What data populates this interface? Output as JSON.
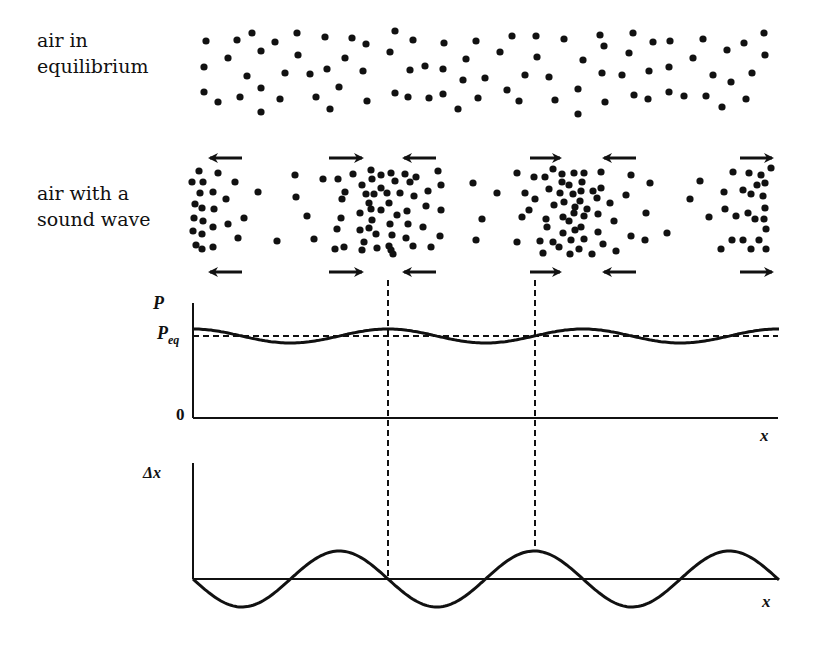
{
  "labels": {
    "equilibrium": "air in\nequilibrium",
    "sound_wave": "air with a\nsound wave"
  },
  "pressure_plot": {
    "y_label": "P",
    "eq_label_main": "P",
    "eq_label_sub": "eq",
    "zero_label": "0",
    "x_label": "x"
  },
  "displacement_plot": {
    "y_label": "Δx",
    "x_label": "x"
  },
  "colors": {
    "ink": "#111111",
    "background": "#ffffff"
  },
  "equilibrium_dots": [
    [
      206,
      41
    ],
    [
      237,
      40
    ],
    [
      252,
      33
    ],
    [
      261,
      51
    ],
    [
      275,
      42
    ],
    [
      297,
      33
    ],
    [
      298,
      55
    ],
    [
      325,
      37
    ],
    [
      352,
      38
    ],
    [
      366,
      44
    ],
    [
      395,
      31
    ],
    [
      413,
      40
    ],
    [
      444,
      43
    ],
    [
      476,
      41
    ],
    [
      390,
      52
    ],
    [
      228,
      58
    ],
    [
      204,
      67
    ],
    [
      247,
      76
    ],
    [
      285,
      73
    ],
    [
      310,
      74
    ],
    [
      327,
      69
    ],
    [
      345,
      58
    ],
    [
      363,
      71
    ],
    [
      410,
      70
    ],
    [
      425,
      66
    ],
    [
      443,
      69
    ],
    [
      466,
      59
    ],
    [
      463,
      80
    ],
    [
      204,
      92
    ],
    [
      218,
      102
    ],
    [
      240,
      97
    ],
    [
      261,
      88
    ],
    [
      280,
      99
    ],
    [
      261,
      112
    ],
    [
      316,
      97
    ],
    [
      339,
      87
    ],
    [
      330,
      109
    ],
    [
      367,
      101
    ],
    [
      395,
      93
    ],
    [
      408,
      97
    ],
    [
      429,
      98
    ],
    [
      443,
      94
    ],
    [
      458,
      109
    ],
    [
      478,
      98
    ],
    [
      512,
      36
    ],
    [
      536,
      36
    ],
    [
      564,
      39
    ],
    [
      600,
      35
    ],
    [
      633,
      33
    ],
    [
      653,
      42
    ],
    [
      670,
      41
    ],
    [
      703,
      39
    ],
    [
      764,
      33
    ],
    [
      500,
      52
    ],
    [
      537,
      57
    ],
    [
      583,
      60
    ],
    [
      604,
      46
    ],
    [
      629,
      53
    ],
    [
      693,
      58
    ],
    [
      727,
      50
    ],
    [
      744,
      43
    ],
    [
      765,
      55
    ],
    [
      485,
      78
    ],
    [
      525,
      75
    ],
    [
      549,
      77
    ],
    [
      602,
      73
    ],
    [
      622,
      75
    ],
    [
      649,
      71
    ],
    [
      669,
      67
    ],
    [
      713,
      75
    ],
    [
      731,
      82
    ],
    [
      752,
      73
    ],
    [
      507,
      90
    ],
    [
      519,
      101
    ],
    [
      555,
      100
    ],
    [
      578,
      89
    ],
    [
      578,
      114
    ],
    [
      605,
      102
    ],
    [
      634,
      95
    ],
    [
      648,
      99
    ],
    [
      669,
      92
    ],
    [
      684,
      96
    ],
    [
      706,
      96
    ],
    [
      722,
      107
    ],
    [
      746,
      99
    ]
  ],
  "wave_dots": [
    [
      199,
      171
    ],
    [
      218,
      173
    ],
    [
      192,
      182
    ],
    [
      203,
      182
    ],
    [
      235,
      182
    ],
    [
      200,
      193
    ],
    [
      213,
      192
    ],
    [
      226,
      199
    ],
    [
      258,
      192
    ],
    [
      195,
      204
    ],
    [
      202,
      208
    ],
    [
      214,
      209
    ],
    [
      194,
      218
    ],
    [
      203,
      221
    ],
    [
      213,
      227
    ],
    [
      228,
      224
    ],
    [
      244,
      218
    ],
    [
      193,
      231
    ],
    [
      202,
      234
    ],
    [
      238,
      238
    ],
    [
      196,
      245
    ],
    [
      202,
      249
    ],
    [
      213,
      247
    ],
    [
      277,
      241
    ],
    [
      295,
      175
    ],
    [
      296,
      197
    ],
    [
      307,
      216
    ],
    [
      314,
      239
    ],
    [
      323,
      179
    ],
    [
      338,
      179
    ],
    [
      353,
      174
    ],
    [
      371,
      170
    ],
    [
      381,
      175
    ],
    [
      391,
      173
    ],
    [
      405,
      174
    ],
    [
      416,
      177
    ],
    [
      438,
      171
    ],
    [
      441,
      185
    ],
    [
      372,
      179
    ],
    [
      395,
      181
    ],
    [
      410,
      182
    ],
    [
      362,
      185
    ],
    [
      381,
      188
    ],
    [
      345,
      192
    ],
    [
      366,
      194
    ],
    [
      374,
      194
    ],
    [
      387,
      193
    ],
    [
      400,
      193
    ],
    [
      414,
      196
    ],
    [
      428,
      191
    ],
    [
      342,
      199
    ],
    [
      369,
      203
    ],
    [
      389,
      203
    ],
    [
      371,
      209
    ],
    [
      381,
      210
    ],
    [
      360,
      213
    ],
    [
      397,
      215
    ],
    [
      407,
      211
    ],
    [
      426,
      206
    ],
    [
      441,
      210
    ],
    [
      341,
      218
    ],
    [
      372,
      220
    ],
    [
      390,
      224
    ],
    [
      408,
      224
    ],
    [
      369,
      228
    ],
    [
      360,
      230
    ],
    [
      337,
      229
    ],
    [
      423,
      227
    ],
    [
      376,
      234
    ],
    [
      392,
      235
    ],
    [
      406,
      238
    ],
    [
      440,
      236
    ],
    [
      364,
      242
    ],
    [
      389,
      246
    ],
    [
      413,
      246
    ],
    [
      431,
      247
    ],
    [
      335,
      249
    ],
    [
      344,
      247
    ],
    [
      362,
      250
    ],
    [
      377,
      248
    ],
    [
      391,
      250
    ],
    [
      393,
      254
    ],
    [
      473,
      183
    ],
    [
      482,
      219
    ],
    [
      476,
      240
    ],
    [
      497,
      193
    ],
    [
      517,
      173
    ],
    [
      534,
      177
    ],
    [
      545,
      177
    ],
    [
      553,
      169
    ],
    [
      562,
      174
    ],
    [
      574,
      173
    ],
    [
      584,
      173
    ],
    [
      601,
      172
    ],
    [
      631,
      175
    ],
    [
      650,
      183
    ],
    [
      562,
      182
    ],
    [
      569,
      185
    ],
    [
      582,
      182
    ],
    [
      601,
      188
    ],
    [
      626,
      195
    ],
    [
      525,
      193
    ],
    [
      535,
      199
    ],
    [
      549,
      189
    ],
    [
      560,
      193
    ],
    [
      573,
      194
    ],
    [
      581,
      191
    ],
    [
      593,
      191
    ],
    [
      597,
      198
    ],
    [
      610,
      203
    ],
    [
      529,
      210
    ],
    [
      522,
      217
    ],
    [
      554,
      205
    ],
    [
      564,
      202
    ],
    [
      575,
      207
    ],
    [
      580,
      201
    ],
    [
      587,
      209
    ],
    [
      574,
      213
    ],
    [
      563,
      217
    ],
    [
      569,
      221
    ],
    [
      584,
      216
    ],
    [
      598,
      214
    ],
    [
      646,
      213
    ],
    [
      614,
      221
    ],
    [
      546,
      219
    ],
    [
      547,
      227
    ],
    [
      563,
      233
    ],
    [
      575,
      230
    ],
    [
      581,
      227
    ],
    [
      598,
      232
    ],
    [
      667,
      233
    ],
    [
      631,
      236
    ],
    [
      645,
      240
    ],
    [
      517,
      242
    ],
    [
      540,
      241
    ],
    [
      553,
      242
    ],
    [
      571,
      240
    ],
    [
      584,
      239
    ],
    [
      603,
      244
    ],
    [
      543,
      253
    ],
    [
      559,
      247
    ],
    [
      570,
      254
    ],
    [
      579,
      249
    ],
    [
      592,
      254
    ],
    [
      616,
      251
    ],
    [
      700,
      181
    ],
    [
      690,
      199
    ],
    [
      709,
      217
    ],
    [
      733,
      172
    ],
    [
      749,
      173
    ],
    [
      761,
      175
    ],
    [
      771,
      168
    ],
    [
      765,
      183
    ],
    [
      757,
      185
    ],
    [
      724,
      192
    ],
    [
      743,
      190
    ],
    [
      751,
      194
    ],
    [
      763,
      196
    ],
    [
      725,
      209
    ],
    [
      736,
      216
    ],
    [
      748,
      213
    ],
    [
      755,
      219
    ],
    [
      765,
      208
    ],
    [
      764,
      219
    ],
    [
      766,
      229
    ],
    [
      732,
      240
    ],
    [
      743,
      240
    ],
    [
      759,
      240
    ],
    [
      721,
      249
    ],
    [
      751,
      249
    ],
    [
      766,
      249
    ]
  ],
  "arrows": {
    "top_y": 158,
    "bottom_y": 272,
    "items": [
      {
        "x1": 210,
        "x2": 242,
        "dir": "left"
      },
      {
        "x1": 329,
        "x2": 362,
        "dir": "right"
      },
      {
        "x1": 404,
        "x2": 436,
        "dir": "left"
      },
      {
        "x1": 530,
        "x2": 560,
        "dir": "right"
      },
      {
        "x1": 604,
        "x2": 636,
        "dir": "left"
      },
      {
        "x1": 740,
        "x2": 772,
        "dir": "right"
      }
    ]
  },
  "chart_data": [
    {
      "type": "line",
      "title": "Pressure vs position",
      "xlabel": "x",
      "ylabel": "P",
      "y_ticks": [
        "0",
        "P_eq"
      ],
      "series": [
        {
          "name": "P(x)",
          "description": "P_eq + small-amplitude cosine, maxima at compressions",
          "x_px_range": [
            193,
            780
          ],
          "wavelength_px": 195,
          "max_at_px": [
            388,
            583,
            778
          ],
          "min_at_px": [
            291,
            486,
            681
          ]
        },
        {
          "name": "P_eq",
          "style": "dashed",
          "constant": true
        }
      ]
    },
    {
      "type": "line",
      "title": "Displacement vs position",
      "xlabel": "x",
      "ylabel": "Δx",
      "series": [
        {
          "name": "Δx(x)",
          "description": "-sin(kx) starting at origin, zero crossings at compressions",
          "x_px_range": [
            193,
            780
          ],
          "wavelength_px": 195,
          "zero_crossings_px": [
            193,
            290,
            388,
            485,
            583,
            680,
            778
          ],
          "max_at_px": [
            339,
            534,
            729
          ],
          "min_at_px": [
            242,
            437,
            632
          ]
        }
      ]
    }
  ],
  "guide_lines_x": [
    388,
    535
  ]
}
